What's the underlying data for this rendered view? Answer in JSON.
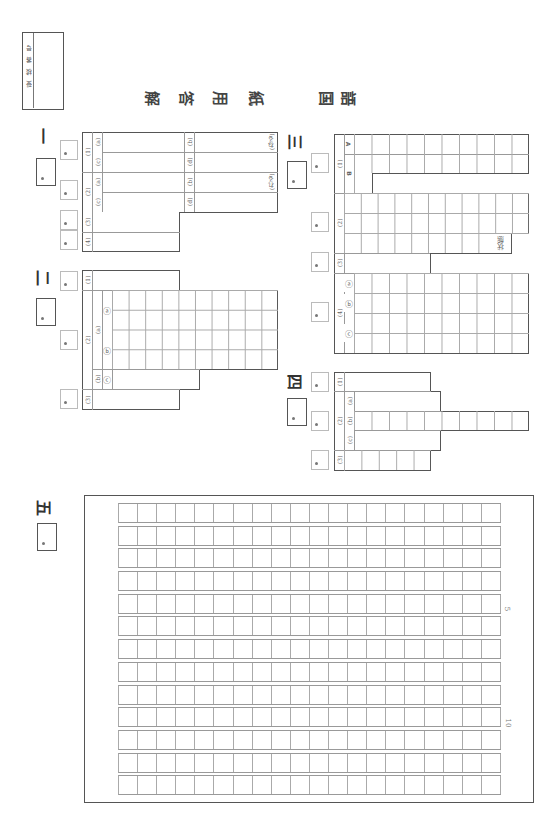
{
  "header": {
    "exam_number_label": "受検番号",
    "title_chars": [
      "解",
      "答",
      "用",
      "紙"
    ],
    "subject_chars": [
      "国",
      "語"
    ]
  },
  "sections": {
    "one": {
      "marker": "一",
      "q1": {
        "label": "(1)",
        "subs": [
          "(a)",
          "(b)",
          "(c)",
          "(d)"
        ],
        "b_suffix": "(ねる)"
      },
      "q2": {
        "label": "(2)",
        "subs": [
          "(a)",
          "(b)",
          "(c)",
          "(d)"
        ],
        "b_suffix": "(れる)"
      },
      "q3": {
        "label": "(3)"
      },
      "q4": {
        "label": "(4)"
      }
    },
    "two": {
      "marker": "二",
      "q1": {
        "label": "(1)"
      },
      "q2": {
        "label": "(2)",
        "a_label": "(a)",
        "b_label": "(b)",
        "circ_a": "ⓐ",
        "circ_b": "ⓑ",
        "circ_c": "ⓒ",
        "cells_per_row": 10
      },
      "q3": {
        "label": "(3)"
      }
    },
    "three": {
      "marker": "三",
      "q1": {
        "label": "(1)",
        "row_a": "A",
        "row_b": "B",
        "cells_a": 10,
        "cells_b": 11
      },
      "q2": {
        "label": "(2)",
        "suffix": "状態",
        "cells_per_row": 11
      },
      "q3": {
        "label": "(3)"
      },
      "q4": {
        "label": "(4)",
        "circ_a": "ⓐ",
        "circ_b": "ⓑ",
        "circ_c": "ⓒ",
        "cells_per_row": 10
      }
    },
    "four": {
      "marker": "四",
      "q1": {
        "label": "(1)"
      },
      "q2": {
        "label": "(2)",
        "subs": [
          "(a)",
          "(b)",
          "(c)"
        ],
        "cells_b": 10
      },
      "q3": {
        "label": "(3)",
        "cells": 5
      }
    },
    "five": {
      "marker": "五",
      "grid_rows": 13,
      "grid_cols": 20,
      "row_markers": [
        "5",
        "10"
      ]
    }
  }
}
